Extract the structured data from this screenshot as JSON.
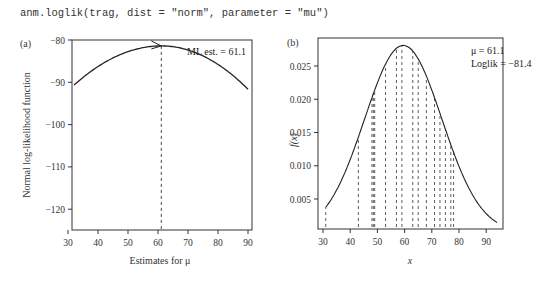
{
  "code": "anm.loglik(trag, dist = \"norm\", parameter = \"mu\")",
  "panels": {
    "a": {
      "label": "(a)",
      "ylabel": "Normal log-likelihood function",
      "xlabel": "Estimates for μ",
      "annotation": "ML est. = 61.1",
      "xticks": [
        "30",
        "40",
        "50",
        "60",
        "70",
        "80",
        "90"
      ],
      "yticks": [
        "−80",
        "−90",
        "−100",
        "−110",
        "−120"
      ]
    },
    "b": {
      "label": "(b)",
      "ylabel": "f(x)",
      "xlabel": "x",
      "annotation_mu": "μ = 61.1",
      "annotation_loglik": "Loglik = −81.4",
      "xticks": [
        "30",
        "40",
        "50",
        "60",
        "70",
        "80",
        "90"
      ],
      "yticks": [
        "0.005",
        "0.010",
        "0.015",
        "0.020",
        "0.025"
      ]
    }
  },
  "chart_data": [
    {
      "type": "line",
      "title": "(a)",
      "xlabel": "Estimates for μ",
      "ylabel": "Normal log-likelihood function",
      "xlim": [
        30,
        92
      ],
      "ylim": [
        -125,
        -80
      ],
      "grid": false,
      "annotations": [
        "ML est. = 61.1",
        "dashed vertical line at μ = 61.1",
        "arrow pointing at maximum"
      ],
      "series": [
        {
          "name": "log-likelihood",
          "x": [
            32,
            35,
            40,
            45,
            50,
            55,
            61.1,
            65,
            70,
            75,
            80,
            85,
            90
          ],
          "values": [
            -123.5,
            -116.5,
            -106.5,
            -97.5,
            -90.0,
            -84.5,
            -81.4,
            -82.5,
            -86.0,
            -92.0,
            -100.0,
            -110.0,
            -122.0
          ]
        }
      ]
    },
    {
      "type": "line",
      "title": "(b)",
      "xlabel": "x",
      "ylabel": "f(x)",
      "xlim": [
        29,
        95
      ],
      "ylim": [
        0,
        0.0285
      ],
      "grid": false,
      "annotations": [
        "μ = 61.1",
        "Loglik = −81.4",
        "dashed vertical lines at observed data points"
      ],
      "series": [
        {
          "name": "normal density",
          "x": [
            31,
            35,
            40,
            45,
            50,
            55,
            60,
            61.1,
            65,
            70,
            75,
            80,
            85,
            90,
            94
          ],
          "values": [
            0.0035,
            0.006,
            0.0105,
            0.016,
            0.0215,
            0.0258,
            0.028,
            0.0281,
            0.0272,
            0.0242,
            0.0195,
            0.014,
            0.0088,
            0.0047,
            0.0022
          ]
        }
      ],
      "data_points_x": [
        31,
        43,
        48,
        48.5,
        49,
        53,
        57,
        59,
        63,
        65,
        68,
        71,
        73,
        75,
        77,
        78
      ]
    }
  ]
}
